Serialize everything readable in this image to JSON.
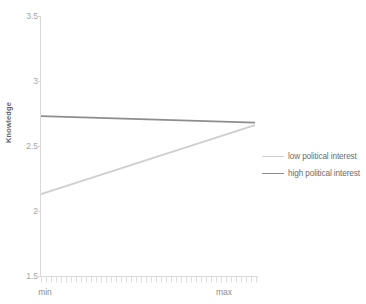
{
  "chart_data": {
    "type": "line",
    "title": "",
    "subtitle": "",
    "xlabel": "",
    "ylabel": "Knowledge",
    "x": [
      "min",
      "max"
    ],
    "xtick_labels": [
      "min",
      "max"
    ],
    "ytick_labels": [
      "3.5",
      "3",
      "2.5",
      "2",
      "1.5"
    ],
    "ytick_values": [
      3.5,
      3,
      2.5,
      2,
      1.5
    ],
    "ylim": [
      1.5,
      3.5
    ],
    "grid": false,
    "legend_position": "right",
    "series": [
      {
        "name": "low political interest",
        "color": "#cfcfcf",
        "values": [
          2.13,
          2.66
        ]
      },
      {
        "name": "high political interest",
        "color": "#8d8d8d",
        "values": [
          2.73,
          2.68
        ]
      }
    ],
    "annotations": []
  },
  "axes": {
    "y_title": "Knowledge",
    "y_ticks": [
      {
        "label": "3.5",
        "value": 3.5
      },
      {
        "label": "3",
        "value": 3
      },
      {
        "label": "2.5",
        "value": 2.5
      },
      {
        "label": "2",
        "value": 2
      },
      {
        "label": "1.5",
        "value": 1.5
      }
    ],
    "x_ticks": [
      {
        "label": "min"
      },
      {
        "label": "max"
      }
    ]
  },
  "legend": {
    "items": [
      {
        "label": "low political interest",
        "color": "#cfcfcf"
      },
      {
        "label": "high political interest",
        "color": "#8d8d8d"
      }
    ]
  },
  "colors": {
    "axis_line": "#d9d9d9",
    "tick_text": "#a6a6a6",
    "series_low": "#cfcfcf",
    "series_high": "#8d8d8d",
    "background": "#ffffff"
  }
}
